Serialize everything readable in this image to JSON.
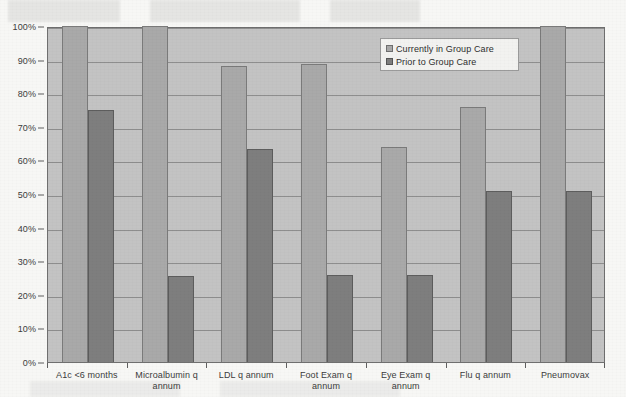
{
  "chart_data": {
    "type": "bar",
    "title": "",
    "subtitle": "",
    "xlabel": "",
    "ylabel": "",
    "ylim": [
      0,
      100
    ],
    "y_tick_labels": [
      "0%",
      "10%",
      "20%",
      "30%",
      "40%",
      "50%",
      "60%",
      "70%",
      "80%",
      "90%",
      "100%"
    ],
    "y_tick_values": [
      0,
      10,
      20,
      30,
      40,
      50,
      60,
      70,
      80,
      90,
      100
    ],
    "grid": true,
    "legend_position": "upper-right-inside",
    "categories": [
      "A1c <6 months",
      "Microalbumin q annum",
      "LDL q annum",
      "Foot Exam q annum",
      "Eye Exam q annum",
      "Flu q annum",
      "Pneumovax"
    ],
    "series": [
      {
        "name": "Currently in Group Care",
        "color": "#a9a9a9",
        "values": [
          100,
          100,
          88,
          88.7,
          64,
          76,
          100
        ]
      },
      {
        "name": "Prior to Group Care",
        "color": "#7e7e7e",
        "values": [
          75,
          25.5,
          63.5,
          26,
          26,
          51,
          51
        ]
      }
    ]
  },
  "legend": {
    "items": [
      {
        "label": "Currently in Group Care",
        "swatch": "series0"
      },
      {
        "label": "Prior to Group Care",
        "swatch": "series1"
      }
    ]
  },
  "colors": {
    "plot_background": "#c3c3c3",
    "page_background": "#f7f7f5",
    "gridline": "#8e8e8e",
    "axis": "#6f6f6f",
    "series_current": "#a9a9a9",
    "series_prior": "#7e7e7e"
  }
}
